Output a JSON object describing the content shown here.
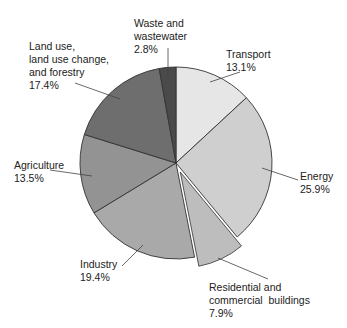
{
  "chart_data": {
    "type": "pie",
    "title": "",
    "start_angle_deg": 0,
    "direction": "clockwise",
    "slices": [
      {
        "name": "Transport",
        "label": "Transport",
        "value": 13.1,
        "pct_text": "13.1%",
        "color": "#e6e6e6",
        "exploded": false
      },
      {
        "name": "Energy",
        "label": "Energy",
        "value": 25.9,
        "pct_text": "25.9%",
        "color": "#cfcfcf",
        "exploded": false
      },
      {
        "name": "Residential and commercial buildings",
        "label": "Residential and\ncommercial  buildings",
        "value": 7.9,
        "pct_text": "7.9%",
        "color": "#bdbdbd",
        "exploded": true
      },
      {
        "name": "Industry",
        "label": "Industry",
        "value": 19.4,
        "pct_text": "19.4%",
        "color": "#a9a9a9",
        "exploded": false
      },
      {
        "name": "Agriculture",
        "label": "Agriculture",
        "value": 13.5,
        "pct_text": "13.5%",
        "color": "#939393",
        "exploded": false
      },
      {
        "name": "Land use, land use change, and forestry",
        "label": "Land use,\nland use change,\nand forestry",
        "value": 17.4,
        "pct_text": "17.4%",
        "color": "#6e6e6e",
        "exploded": false
      },
      {
        "name": "Waste and wastewater",
        "label": "Waste and\nwastewater",
        "value": 2.8,
        "pct_text": "2.8%",
        "color": "#4a4a4a",
        "exploded": false
      }
    ]
  },
  "labels": [
    {
      "text": "Waste and\nwastewater\n2.8%",
      "x": 134,
      "y": 17
    },
    {
      "text": "Transport\n13.1%",
      "x": 226,
      "y": 48
    },
    {
      "text": "Land use,\nland use change,\nand forestry\n17.4%",
      "x": 29,
      "y": 40
    },
    {
      "text": "Agriculture\n13.5%",
      "x": 14,
      "y": 159
    },
    {
      "text": "Energy\n25.9%",
      "x": 300,
      "y": 170
    },
    {
      "text": "Industry\n19.4%",
      "x": 80,
      "y": 258
    },
    {
      "text": "Residential and\ncommercial  buildings\n7.9%",
      "x": 209,
      "y": 281
    }
  ]
}
